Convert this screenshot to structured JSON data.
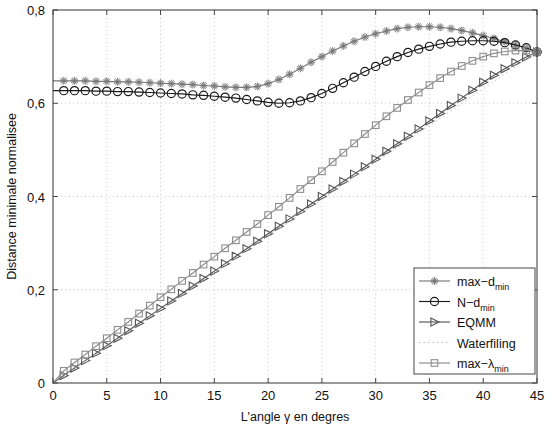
{
  "chart_data": {
    "type": "line",
    "title": "",
    "xlabel": "L'angle γ en degres",
    "ylabel": "Distance minimale normalisee",
    "xlim": [
      0,
      45
    ],
    "ylim": [
      0,
      0.8
    ],
    "xticks": [
      0,
      5,
      10,
      15,
      20,
      25,
      30,
      35,
      40,
      45
    ],
    "xticklabels": [
      "0",
      "5",
      "10",
      "15",
      "20",
      "25",
      "30",
      "35",
      "40",
      "45"
    ],
    "yticks": [
      0,
      0.2,
      0.4,
      0.6,
      0.8
    ],
    "yticklabels": [
      "0",
      "0,2",
      "0,4",
      "0,6",
      "0,8"
    ],
    "grid": true,
    "grid_style": "dotted",
    "legend_position": "lower right",
    "x": [
      0,
      1,
      2,
      3,
      4,
      5,
      6,
      7,
      8,
      9,
      10,
      11,
      12,
      13,
      14,
      15,
      16,
      17,
      18,
      19,
      20,
      21,
      22,
      23,
      24,
      25,
      26,
      27,
      28,
      29,
      30,
      31,
      32,
      33,
      34,
      35,
      36,
      37,
      38,
      39,
      40,
      41,
      42,
      43,
      44,
      45
    ],
    "series": [
      {
        "name": "max−d_min",
        "label_main": "max−d",
        "label_sub": "min",
        "marker": "star",
        "color": "#777777",
        "values": [
          0.648,
          0.648,
          0.648,
          0.648,
          0.647,
          0.647,
          0.646,
          0.646,
          0.645,
          0.644,
          0.643,
          0.642,
          0.641,
          0.64,
          0.638,
          0.637,
          0.635,
          0.634,
          0.634,
          0.636,
          0.642,
          0.651,
          0.662,
          0.675,
          0.688,
          0.7,
          0.712,
          0.723,
          0.733,
          0.742,
          0.749,
          0.755,
          0.76,
          0.763,
          0.764,
          0.764,
          0.763,
          0.76,
          0.756,
          0.751,
          0.745,
          0.739,
          0.732,
          0.725,
          0.718,
          0.71
        ]
      },
      {
        "name": "N−d_min",
        "label_main": "N−d",
        "label_sub": "min",
        "marker": "circle",
        "color": "#1a1a1a",
        "values": [
          0.627,
          0.627,
          0.627,
          0.627,
          0.626,
          0.626,
          0.625,
          0.625,
          0.624,
          0.623,
          0.622,
          0.621,
          0.62,
          0.618,
          0.617,
          0.615,
          0.613,
          0.611,
          0.608,
          0.605,
          0.602,
          0.6,
          0.601,
          0.605,
          0.612,
          0.621,
          0.632,
          0.644,
          0.656,
          0.668,
          0.679,
          0.69,
          0.7,
          0.709,
          0.716,
          0.722,
          0.727,
          0.731,
          0.733,
          0.734,
          0.734,
          0.733,
          0.73,
          0.725,
          0.719,
          0.71
        ]
      },
      {
        "name": "EQMM",
        "label_main": "EQMM",
        "label_sub": "",
        "marker": "triangle-right",
        "color": "#555555",
        "values": [
          0.0,
          0.016,
          0.032,
          0.048,
          0.064,
          0.08,
          0.096,
          0.112,
          0.128,
          0.144,
          0.16,
          0.176,
          0.192,
          0.208,
          0.224,
          0.24,
          0.256,
          0.272,
          0.288,
          0.304,
          0.32,
          0.336,
          0.352,
          0.368,
          0.384,
          0.4,
          0.416,
          0.432,
          0.448,
          0.464,
          0.48,
          0.497,
          0.513,
          0.529,
          0.545,
          0.562,
          0.578,
          0.595,
          0.611,
          0.628,
          0.645,
          0.66,
          0.674,
          0.687,
          0.699,
          0.71
        ]
      },
      {
        "name": "Waterfiling",
        "label_main": "Waterfiling",
        "label_sub": "",
        "marker": "none",
        "color": "#b9b9b9",
        "values": [
          0.0,
          0.0158,
          0.0316,
          0.0473,
          0.0631,
          0.0789,
          0.0947,
          0.1104,
          0.1262,
          0.142,
          0.1578,
          0.1736,
          0.1893,
          0.2051,
          0.2209,
          0.2367,
          0.2524,
          0.2682,
          0.284,
          0.2998,
          0.3156,
          0.3313,
          0.3471,
          0.3629,
          0.3787,
          0.3944,
          0.4102,
          0.426,
          0.4418,
          0.4576,
          0.4733,
          0.4891,
          0.5049,
          0.5207,
          0.5364,
          0.5522,
          0.568,
          0.5838,
          0.5996,
          0.6153,
          0.6311,
          0.6469,
          0.6627,
          0.6784,
          0.6942,
          0.71
        ]
      },
      {
        "name": "max−λ_min",
        "label_main": "max−λ",
        "label_sub": "min",
        "marker": "square",
        "color": "#8d8d8d",
        "values": [
          0.0,
          0.026,
          0.044,
          0.061,
          0.079,
          0.096,
          0.114,
          0.131,
          0.149,
          0.166,
          0.184,
          0.201,
          0.219,
          0.236,
          0.254,
          0.271,
          0.289,
          0.306,
          0.324,
          0.341,
          0.36,
          0.378,
          0.397,
          0.416,
          0.435,
          0.454,
          0.474,
          0.494,
          0.514,
          0.534,
          0.553,
          0.572,
          0.59,
          0.607,
          0.623,
          0.639,
          0.654,
          0.668,
          0.68,
          0.691,
          0.7,
          0.707,
          0.711,
          0.713,
          0.713,
          0.71
        ]
      }
    ]
  },
  "legend": {
    "entries": [
      {
        "label_main": "max−d",
        "label_sub": "min",
        "marker": "star",
        "color": "#777777"
      },
      {
        "label_main": "N−d",
        "label_sub": "min",
        "marker": "circle",
        "color": "#1a1a1a"
      },
      {
        "label_main": "EQMM",
        "label_sub": "",
        "marker": "triangle-right",
        "color": "#555555"
      },
      {
        "label_main": "Waterfiling",
        "label_sub": "",
        "marker": "none",
        "color": "#b9b9b9"
      },
      {
        "label_main": "max−λ",
        "label_sub": "min",
        "marker": "square",
        "color": "#8d8d8d"
      }
    ]
  },
  "colors": {
    "axis": "#444444",
    "grid": "#bdbdbd",
    "background": "#ffffff"
  }
}
